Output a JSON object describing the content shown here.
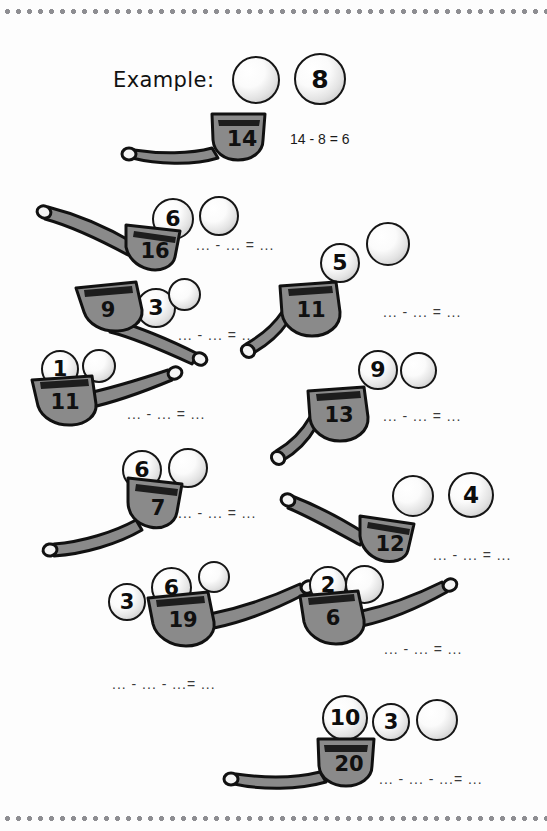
{
  "worksheet": {
    "example": {
      "label": "Example:",
      "equation": "14 - 8 = 6",
      "pipe_value": "14",
      "ball_value": "8",
      "blank_ball": ""
    },
    "answer_blank_two": "... - ... = ...",
    "answer_blank_three": "... - ... - ...= ...",
    "problems": [
      {
        "id": "problem-1",
        "pipe_value": "16",
        "balls": [
          "6",
          ""
        ],
        "answer": "... - ... = ..."
      },
      {
        "id": "problem-2",
        "pipe_value": "9",
        "balls": [
          "3",
          ""
        ],
        "answer": "... - ... = ..."
      },
      {
        "id": "problem-3",
        "pipe_value": "11",
        "balls": [
          "1",
          ""
        ],
        "answer": "... - ... = ..."
      },
      {
        "id": "problem-4",
        "pipe_value": "7",
        "balls": [
          "6",
          ""
        ],
        "answer": "... - ... = ..."
      },
      {
        "id": "problem-5",
        "pipe_value": "11",
        "balls": [
          "5",
          ""
        ],
        "answer": "... - ... = ..."
      },
      {
        "id": "problem-6",
        "pipe_value": "13",
        "balls": [
          "9",
          ""
        ],
        "answer": "... - ... = ..."
      },
      {
        "id": "problem-7",
        "pipe_value": "12",
        "balls": [
          "",
          "4"
        ],
        "answer": "... - ... = ..."
      },
      {
        "id": "problem-8",
        "pipe_value": "19",
        "balls": [
          "3",
          "6",
          ""
        ],
        "answer": "... - ... - ...= ..."
      },
      {
        "id": "problem-9",
        "pipe_value": "6",
        "balls": [
          "2",
          ""
        ],
        "answer": "... - ... = ..."
      },
      {
        "id": "problem-10",
        "pipe_value": "20",
        "balls": [
          "10",
          "3",
          ""
        ],
        "answer": "... - ... - ...= ..."
      }
    ]
  },
  "colors": {
    "pipe_fill": "#8a8a8a",
    "pipe_stroke": "#111111",
    "ball_fill": "#f2f2f2",
    "ball_stroke": "#161616",
    "border_dots": "#8e8e92",
    "page_background": "#fdfdfd"
  }
}
